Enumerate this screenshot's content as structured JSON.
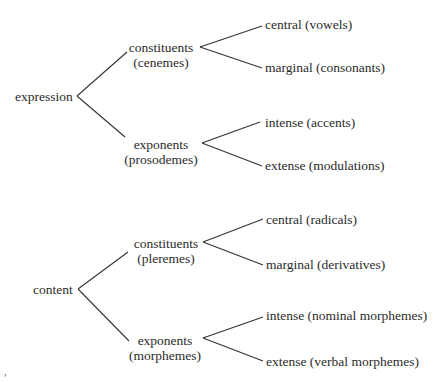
{
  "diagram": {
    "type": "tree",
    "trees": [
      {
        "root": "expression",
        "branches": [
          {
            "label": "constituents",
            "sublabel": "(cenemes)",
            "leaves": [
              "central (vowels)",
              "marginal (consonants)"
            ]
          },
          {
            "label": "exponents",
            "sublabel": "(prosodemes)",
            "leaves": [
              "intense (accents)",
              "extense (modulations)"
            ]
          }
        ]
      },
      {
        "root": "content",
        "branches": [
          {
            "label": "constituents",
            "sublabel": "(pleremes)",
            "leaves": [
              "central (radicals)",
              "marginal (derivatives)"
            ]
          },
          {
            "label": "exponents",
            "sublabel": "(morphemes)",
            "leaves": [
              "intense (nominal morphemes)",
              "extense (verbal morphemes)"
            ]
          }
        ]
      }
    ],
    "footnote_mark": ","
  }
}
